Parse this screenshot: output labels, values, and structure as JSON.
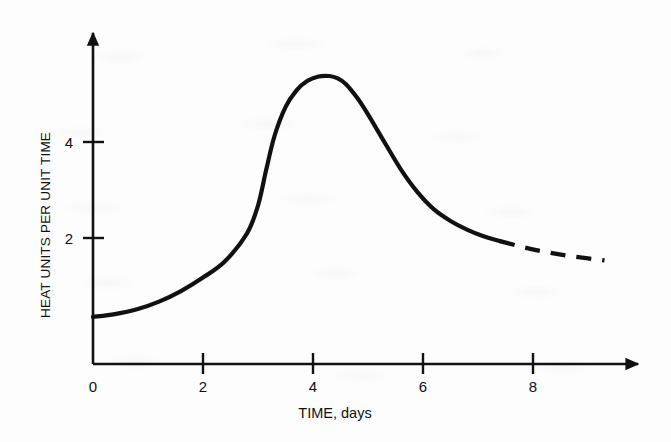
{
  "chart_data": {
    "type": "line",
    "title": "",
    "subtitle": "",
    "xlabel": "TIME, days",
    "ylabel": "HEAT UNITS PER UNIT TIME",
    "xlim": [
      0,
      9.6
    ],
    "ylim": [
      0,
      6.9
    ],
    "x_ticks": [
      0,
      2,
      4,
      6,
      8
    ],
    "x_tick_labels": [
      "0",
      "2",
      "4",
      "6",
      "8"
    ],
    "y_ticks": [
      2,
      4
    ],
    "y_tick_labels": [
      "2",
      "4"
    ],
    "grid": false,
    "legend": null,
    "axis_style": "arrowed-open-axes",
    "line_color": "#111111",
    "line_width_px": 4.2,
    "series": [
      {
        "name": "heat evolution rate",
        "style": "solid",
        "x": [
          0.0,
          0.4,
          0.8,
          1.2,
          1.6,
          2.0,
          2.4,
          2.8,
          3.0,
          3.15,
          3.3,
          3.5,
          3.7,
          3.9,
          4.1,
          4.3,
          4.45,
          4.6,
          4.8,
          5.0,
          5.3,
          5.6,
          5.9,
          6.2,
          6.5,
          6.8,
          7.1,
          7.4
        ],
        "y": [
          0.98,
          1.04,
          1.14,
          1.3,
          1.52,
          1.8,
          2.14,
          2.72,
          3.3,
          4.05,
          4.75,
          5.35,
          5.7,
          5.9,
          5.99,
          6.0,
          5.95,
          5.83,
          5.55,
          5.2,
          4.62,
          4.05,
          3.58,
          3.22,
          2.98,
          2.8,
          2.66,
          2.56
        ]
      },
      {
        "name": "heat evolution rate (extrapolated)",
        "style": "dashed",
        "dash_pattern_px": [
          15,
          11
        ],
        "x": [
          7.4,
          7.8,
          8.2,
          8.6,
          9.0,
          9.3
        ],
        "y": [
          2.56,
          2.44,
          2.34,
          2.26,
          2.2,
          2.16
        ]
      }
    ]
  },
  "axes": {
    "x_axis_name": "time-axis",
    "y_axis_name": "heat-rate-axis"
  }
}
